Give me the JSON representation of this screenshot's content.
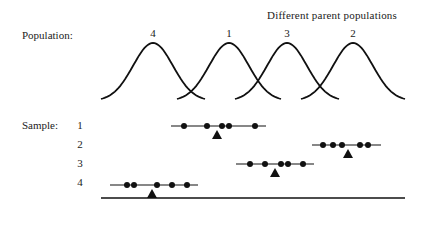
{
  "diagram": {
    "title": "Different parent populations",
    "population_label": "Population:",
    "sample_label": "Sample:",
    "colors": {
      "ink": "#111111",
      "background": "#ffffff"
    },
    "populations": [
      {
        "label": "4",
        "peak_x": 153
      },
      {
        "label": "1",
        "peak_x": 229
      },
      {
        "label": "3",
        "peak_x": 287
      },
      {
        "label": "2",
        "peak_x": 353
      }
    ],
    "samples": [
      {
        "label": "1",
        "y": 126,
        "line": [
          171,
          266
        ],
        "points": [
          184,
          207,
          222,
          229,
          255
        ],
        "mean_x": 217
      },
      {
        "label": "2",
        "y": 145,
        "line": [
          312,
          381
        ],
        "points": [
          323,
          333,
          342,
          360,
          368
        ],
        "mean_x": 348
      },
      {
        "label": "3",
        "y": 164,
        "line": [
          236,
          314
        ],
        "points": [
          250,
          265,
          281,
          288,
          303
        ],
        "mean_x": 275
      },
      {
        "label": "4",
        "y": 185,
        "line": [
          110,
          198
        ],
        "points": [
          127,
          134,
          157,
          172,
          187
        ],
        "mean_x": 152
      }
    ],
    "baseline": {
      "x1": 101,
      "x2": 405,
      "y": 198
    },
    "curve": {
      "half_width": 52,
      "top_y": 43,
      "bottom_y": 101
    },
    "markers": {
      "point": "filled-circle",
      "mean": "filled-triangle"
    }
  }
}
